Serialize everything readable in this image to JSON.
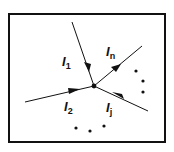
{
  "diagram": {
    "node": {
      "x": 94,
      "y": 86
    },
    "currents": [
      {
        "id": "I1",
        "letter": "I",
        "sub": "1",
        "from": [
          72,
          22
        ],
        "to": [
          94,
          86
        ],
        "direction": "into-node"
      },
      {
        "id": "In",
        "letter": "I",
        "sub": "n",
        "from": [
          142,
          46
        ],
        "to": [
          94,
          86
        ],
        "direction": "into-node"
      },
      {
        "id": "I2",
        "letter": "I",
        "sub": "2",
        "from": [
          25,
          102
        ],
        "to": [
          94,
          86
        ],
        "direction": "into-node"
      },
      {
        "id": "Ij",
        "letter": "I",
        "sub": "j",
        "from": [
          148,
          111
        ],
        "to": [
          94,
          86
        ],
        "direction": "into-node"
      }
    ],
    "ellipsis_right": [
      [
        136,
        71
      ],
      [
        143,
        81
      ],
      [
        143,
        92
      ]
    ],
    "ellipsis_bottom": [
      [
        76,
        128
      ],
      [
        90,
        131
      ],
      [
        104,
        126
      ]
    ],
    "colors": {
      "line": "#111111",
      "frame": "#111111",
      "background": "#ffffff"
    }
  }
}
